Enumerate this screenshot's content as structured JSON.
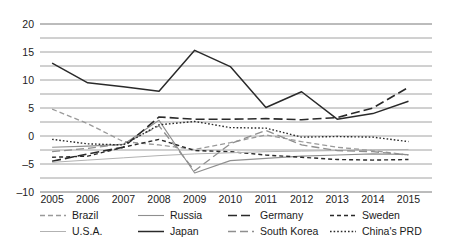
{
  "chart_data": {
    "type": "line",
    "title": "",
    "xlabel": "",
    "ylabel": "",
    "x": [
      2005,
      2006,
      2007,
      2008,
      2009,
      2010,
      2011,
      2012,
      2013,
      2014,
      2015
    ],
    "categories": [
      "2005",
      "2006",
      "2007",
      "2008",
      "2009",
      "2010",
      "2011",
      "2012",
      "2013",
      "2014",
      "2015"
    ],
    "ylim": [
      -10,
      20
    ],
    "yticks": [
      -10,
      -5,
      0,
      5,
      10,
      15,
      20
    ],
    "ytick_labels": [
      "–10",
      "–5",
      "0",
      "5",
      "10",
      "15",
      "20"
    ],
    "minor_grid_step": 2.5,
    "grid": true,
    "legend_position": "bottom",
    "series": [
      {
        "name": "Brazil",
        "style": "dashed",
        "color": "#9a9a9a",
        "width": 1.3,
        "dash": "5,3",
        "values": [
          4.8,
          2.2,
          -1.0,
          -1.6,
          -2.4,
          -1.2,
          0.2,
          -1.0,
          -2.0,
          -2.6,
          -3.4
        ]
      },
      {
        "name": "Russia",
        "style": "solid",
        "color": "#8f8f8f",
        "width": 1.1,
        "dash": "",
        "values": [
          -2.0,
          -1.8,
          -1.5,
          2.8,
          -6.6,
          -4.4,
          -4.0,
          -3.6,
          -3.4,
          -3.2,
          -3.3
        ]
      },
      {
        "name": "Germany",
        "style": "long-dash",
        "color": "#2a2a2a",
        "width": 1.6,
        "dash": "9,4",
        "values": [
          -4.5,
          -3.2,
          -2.0,
          3.4,
          3.0,
          3.0,
          3.1,
          2.9,
          3.3,
          5.0,
          8.7
        ]
      },
      {
        "name": "Sweden",
        "style": "short-dash",
        "color": "#2a2a2a",
        "width": 1.4,
        "dash": "4,3",
        "values": [
          -3.8,
          -3.6,
          -2.0,
          -0.6,
          -2.6,
          -2.8,
          -3.4,
          -3.8,
          -4.2,
          -4.3,
          -4.2
        ]
      },
      {
        "name": "U.S.A.",
        "style": "solid",
        "color": "#b2b2b2",
        "width": 1.0,
        "dash": "",
        "values": [
          -4.7,
          -4.3,
          -3.9,
          -3.5,
          -3.2,
          -3.0,
          -2.8,
          -2.7,
          -2.6,
          -2.5,
          -2.4
        ]
      },
      {
        "name": "Japan",
        "style": "solid",
        "color": "#2a2a2a",
        "width": 1.5,
        "dash": "",
        "values": [
          13.0,
          9.5,
          8.8,
          8.0,
          15.3,
          12.4,
          5.1,
          7.9,
          3.0,
          4.0,
          6.2
        ]
      },
      {
        "name": "South Korea",
        "style": "long-dash",
        "color": "#8f8f8f",
        "width": 1.3,
        "dash": "8,4",
        "values": [
          -2.8,
          -2.2,
          -1.4,
          1.8,
          -6.2,
          -1.4,
          1.0,
          -1.6,
          -2.6,
          -2.8,
          -3.4
        ]
      },
      {
        "name": "China's PRD",
        "style": "dotted",
        "color": "#2a2a2a",
        "width": 1.4,
        "dash": "1.6,2",
        "values": [
          -0.6,
          -1.4,
          -1.6,
          2.0,
          2.6,
          1.5,
          1.4,
          -0.2,
          -0.1,
          -0.2,
          -1.0
        ]
      }
    ]
  },
  "legend": {
    "rows": [
      [
        {
          "label": "Brazil",
          "series": 0
        },
        {
          "label": "Russia",
          "series": 1
        },
        {
          "label": "Germany",
          "series": 2
        },
        {
          "label": "Sweden",
          "series": 3
        }
      ],
      [
        {
          "label": "U.S.A.",
          "series": 4
        },
        {
          "label": "Japan",
          "series": 5
        },
        {
          "label": "South Korea",
          "series": 6
        },
        {
          "label": "China's PRD",
          "series": 7
        }
      ]
    ]
  }
}
